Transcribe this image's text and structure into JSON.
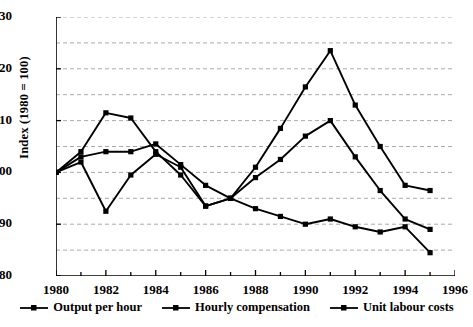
{
  "chart_data": {
    "type": "line",
    "title": "",
    "xlabel": "",
    "ylabel": "Index (1980 = 100)",
    "xlim": [
      1980,
      1996
    ],
    "ylim": [
      80,
      130
    ],
    "yticks": [
      80,
      90,
      100,
      110,
      120,
      130
    ],
    "ygrid_minor": [
      85,
      95,
      105,
      115,
      125
    ],
    "xticks": [
      1980,
      1982,
      1984,
      1986,
      1988,
      1990,
      1992,
      1994,
      1996
    ],
    "xtick_minor_every": 1,
    "grid": "horizontal dashed",
    "legend_position": "bottom",
    "x": [
      1980,
      1981,
      1982,
      1983,
      1984,
      1985,
      1986,
      1987,
      1988,
      1989,
      1990,
      1991,
      1992,
      1993,
      1994,
      1995
    ],
    "series": [
      {
        "name": "Output per hour",
        "color": "#000000",
        "marker": "square",
        "values": [
          100,
          103,
          104,
          104,
          105.5,
          101.5,
          97.5,
          95,
          99,
          102.5,
          107,
          110,
          103,
          96.5,
          91,
          89
        ]
      },
      {
        "name": "Hourly compensation",
        "color": "#000000",
        "marker": "square",
        "values": [
          100,
          104,
          111.5,
          110.5,
          104,
          99.5,
          93.5,
          95,
          101,
          108.5,
          116.5,
          123.5,
          113,
          105,
          97.5,
          96.5
        ]
      },
      {
        "name": "Unit labour costs",
        "color": "#000000",
        "marker": "square",
        "values": [
          100,
          102,
          92.5,
          99.5,
          103.5,
          101,
          93.5,
          95,
          93,
          91.5,
          90,
          91,
          89.5,
          88.5,
          89.5,
          84.5
        ]
      }
    ]
  },
  "axis": {
    "y_title": "Index (1980 = 100)",
    "y_labels": [
      "130",
      "120",
      "110",
      "100",
      "90",
      "80"
    ],
    "x_labels": [
      "1980",
      "1982",
      "1984",
      "1986",
      "1988",
      "1990",
      "1992",
      "1994",
      "1996"
    ]
  },
  "legend": {
    "items": [
      {
        "label": "Output per hour"
      },
      {
        "label": "Hourly compensation"
      },
      {
        "label": "Unit labour costs"
      }
    ]
  }
}
